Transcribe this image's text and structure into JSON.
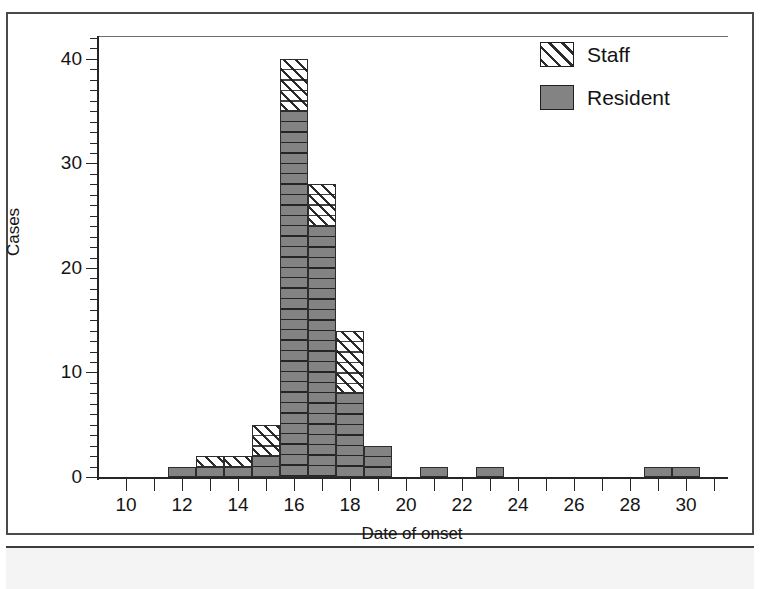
{
  "figure": {
    "caption_placeholder": "",
    "legend_position": "top-right"
  },
  "legend": {
    "entries": [
      {
        "label": "Staff",
        "swatch": "hatched-diagonal",
        "color": "#ffffff"
      },
      {
        "label": "Resident",
        "swatch": "solid",
        "color": "#838383"
      }
    ]
  },
  "chart_data": {
    "type": "bar",
    "title": "",
    "subtitle": "",
    "xlabel": "Date of onset",
    "ylabel": "Cases",
    "xlim": [
      9,
      31.5
    ],
    "ylim": [
      0,
      42
    ],
    "grid": false,
    "stacked": true,
    "bar_width": 1,
    "x_tick_step": 1,
    "x_label_step": 2,
    "y_major_step": 10,
    "y_minor_step": 1,
    "x_tick_labels": [
      "10",
      "12",
      "14",
      "16",
      "18",
      "20",
      "22",
      "24",
      "26",
      "28",
      "30"
    ],
    "x_tick_values": [
      10,
      12,
      14,
      16,
      18,
      20,
      22,
      24,
      26,
      28,
      30
    ],
    "y_tick_labels": [
      "0",
      "10",
      "20",
      "30",
      "40"
    ],
    "y_tick_values": [
      0,
      10,
      20,
      30,
      40
    ],
    "categories": [
      10,
      11,
      12,
      13,
      14,
      15,
      16,
      17,
      18,
      19,
      20,
      21,
      22,
      23,
      24,
      25,
      26,
      27,
      28,
      29,
      30
    ],
    "series": [
      {
        "name": "Resident",
        "color": "#838383",
        "pattern": "solid",
        "values": [
          0,
          0,
          1,
          1,
          1,
          2,
          35,
          24,
          8,
          3,
          0,
          1,
          0,
          1,
          0,
          0,
          0,
          0,
          0,
          1,
          1
        ]
      },
      {
        "name": "Staff",
        "color": "#ffffff",
        "pattern": "hatch-45",
        "values": [
          0,
          0,
          0,
          1,
          1,
          3,
          5,
          4,
          6,
          0,
          0,
          0,
          0,
          0,
          0,
          0,
          0,
          0,
          0,
          0,
          0
        ]
      }
    ],
    "totals": [
      0,
      0,
      1,
      2,
      2,
      5,
      40,
      28,
      14,
      3,
      0,
      1,
      0,
      1,
      0,
      0,
      0,
      0,
      0,
      1,
      1
    ],
    "annotations": []
  }
}
